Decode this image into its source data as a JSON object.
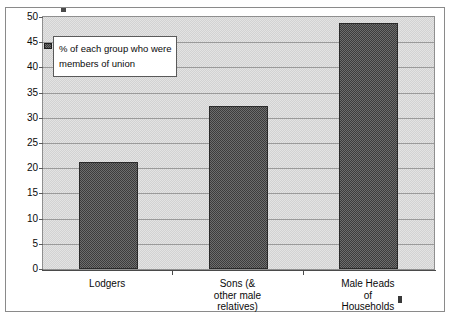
{
  "chart_data": {
    "type": "bar",
    "title": "",
    "subtitle": "",
    "xlabel": "",
    "ylabel": "",
    "categories": [
      "Lodgers",
      "Sons (&\nother male\nrelatives)",
      "Male Heads\nof\nHouseholds"
    ],
    "values": [
      21.2,
      32.3,
      48.8
    ],
    "ylim": [
      0,
      50
    ],
    "yticks": [
      0,
      5,
      10,
      15,
      20,
      25,
      30,
      35,
      40,
      45,
      50
    ],
    "ytick_labels": [
      "0",
      "5",
      "10",
      "15",
      "20",
      "25",
      "30",
      "35",
      "40",
      "45",
      "50"
    ],
    "grid": true,
    "grid_axis": "y",
    "legend": {
      "position": "upper-left-inside",
      "entries": [
        {
          "label": "% of each group who were members of union",
          "swatch": "hatched-dark-gray"
        }
      ]
    },
    "series": [
      {
        "name": "% of each group who were members of union",
        "values": [
          21.2,
          32.3,
          48.8
        ]
      }
    ],
    "colors": {
      "bar_fill": "#6d6d6d",
      "bar_border": "#2a2a2a",
      "plot_background": "#e3e3e3",
      "gridline": "#9a9a9a",
      "axis": "#4a4a4a",
      "text": "#0a0a0a",
      "legend_background": "#ffffff",
      "frame_border": "#8a8a8a"
    }
  },
  "legend": {
    "text": "% of each group who were members of union"
  }
}
